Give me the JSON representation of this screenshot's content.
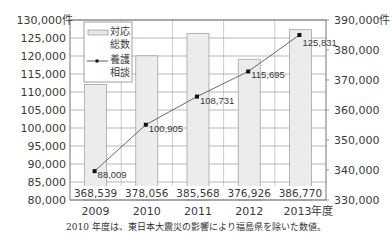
{
  "chart_data": {
    "type": "bar+line",
    "title": "",
    "categories": [
      "2009",
      "2010",
      "2011",
      "2012",
      "2013"
    ],
    "x_unit_suffix": "年度",
    "series": [
      {
        "name": "対応総数",
        "type": "bar",
        "axis": "right",
        "values": [
          368539,
          378056,
          385568,
          376926,
          386770
        ],
        "labels": [
          "368,539",
          "378,056",
          "385,568",
          "376,926",
          "386,770"
        ],
        "color": "#ececec"
      },
      {
        "name": "養護相談",
        "type": "line",
        "axis": "left",
        "values": [
          88009,
          100905,
          108731,
          115695,
          125831
        ],
        "labels": [
          "88,009",
          "100,905",
          "108,731",
          "115,695",
          "125,831"
        ],
        "color": "#222222"
      }
    ],
    "left_axis": {
      "ylim": [
        80000,
        130000
      ],
      "ticks": [
        "80,000",
        "85,000",
        "90,000",
        "95,000",
        "100,000",
        "105,000",
        "110,000",
        "115,000",
        "120,000",
        "125,000",
        "130,000件"
      ]
    },
    "right_axis": {
      "ylim": [
        330000,
        390000
      ],
      "ticks": [
        "330,000",
        "340,000",
        "350,000",
        "360,000",
        "370,000",
        "380,000",
        "390,000件"
      ]
    },
    "legend": {
      "position": "upper-left-inside",
      "entries": [
        {
          "line1": "対応",
          "line2": "総数",
          "symbol": "bar"
        },
        {
          "line1": "養護",
          "line2": "相談",
          "symbol": "line-marker"
        }
      ]
    },
    "grid": true
  },
  "footnote": "2010 年度は、東日本大震災の影響により福島県を除いた数値。"
}
